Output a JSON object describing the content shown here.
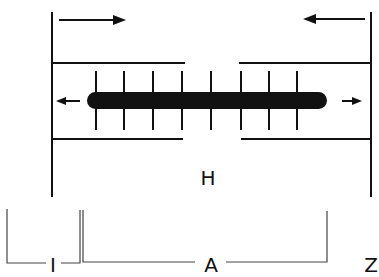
{
  "diagram": {
    "labels": {
      "h_zone": "H",
      "i_band": "I",
      "a_band": "A",
      "z_line": "Z"
    },
    "arrows": {
      "top_left": "right",
      "top_right": "left",
      "mid_left": "left",
      "mid_right": "right"
    },
    "colors": {
      "line": "#111111",
      "background": "#ffffff"
    }
  }
}
